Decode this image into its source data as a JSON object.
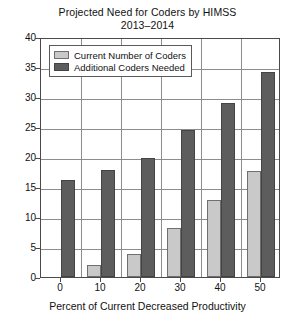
{
  "chart_data": {
    "type": "bar",
    "title": "Projected Need for Coders by HIMSS 2013–2014",
    "title_lines": [
      "Projected Need for Coders by HIMSS",
      "2013–2014"
    ],
    "xlabel": "Percent of Current Decreased Productivity",
    "ylabel": "",
    "categories": [
      "0",
      "10",
      "20",
      "30",
      "40",
      "50"
    ],
    "series": [
      {
        "name": "Current Number of Coders",
        "color": "#c9c9c9",
        "values": [
          0,
          2,
          3.8,
          8.2,
          12.8,
          17.6
        ]
      },
      {
        "name": "Additional Coders Needed",
        "color": "#5d5d5d",
        "values": [
          16.2,
          17.9,
          19.8,
          24.5,
          29,
          34.1
        ]
      }
    ],
    "ylim": [
      0,
      40
    ],
    "yticks": [
      0,
      5,
      10,
      15,
      20,
      25,
      30,
      35,
      40
    ],
    "ytick_labels": [
      "0",
      "5",
      "10",
      "15",
      "20",
      "25",
      "30",
      "35",
      "40"
    ],
    "grid": true,
    "legend_position": "upper left"
  },
  "legend": {
    "items": [
      {
        "label": "Current Number of Coders",
        "swatch": "light"
      },
      {
        "label": "Additional Coders Needed",
        "swatch": "dark"
      }
    ]
  },
  "colors": {
    "series_light": "#c9c9c9",
    "series_dark": "#5d5d5d",
    "gridline": "#8d8d8d",
    "axis": "#4a4a4a",
    "background": "#ffffff",
    "text": "#111111"
  }
}
